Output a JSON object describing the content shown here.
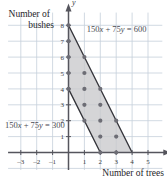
{
  "chart_data": {
    "type": "scatter",
    "title": "",
    "xlabel": "Number of trees",
    "ylabel": "Number of bushes",
    "xlim": [
      -3.8,
      5.9
    ],
    "ylim": [
      -1.1,
      8.8
    ],
    "grid": true,
    "legend": "none",
    "xticks": [
      -3,
      -2,
      -1,
      1,
      2,
      3,
      4,
      5
    ],
    "yticks": [
      1,
      2,
      3,
      4,
      5,
      6,
      7,
      8
    ],
    "x_axis_name": "x",
    "y_axis_name": "y",
    "annotations": [
      {
        "text": "150x + 75y = 600",
        "x": 1.15,
        "y": 7.55
      },
      {
        "text": "150x + 75y = 300",
        "x": -3.6,
        "y": 1.55
      }
    ],
    "lines": [
      {
        "label": "150x + 75y = 600",
        "from": [
          0,
          8
        ],
        "to": [
          4,
          0
        ],
        "slope": -2,
        "intercept": 8
      },
      {
        "label": "150x + 75y = 300",
        "from": [
          0,
          4
        ],
        "to": [
          2,
          0
        ],
        "slope": -2,
        "intercept": 4
      }
    ],
    "region": {
      "label": "feasible-region",
      "fill": "#c9c9cc",
      "vertices": [
        [
          0,
          8
        ],
        [
          4,
          0
        ],
        [
          2,
          0
        ],
        [
          0,
          4
        ]
      ]
    },
    "points": [
      [
        0,
        8
      ],
      [
        0,
        7
      ],
      [
        0,
        6
      ],
      [
        0,
        5
      ],
      [
        0,
        4
      ],
      [
        1,
        6
      ],
      [
        1,
        5
      ],
      [
        1,
        4
      ],
      [
        1,
        3
      ],
      [
        1,
        2
      ],
      [
        2,
        4
      ],
      [
        2,
        3
      ],
      [
        2,
        2
      ],
      [
        2,
        1
      ],
      [
        2,
        0
      ],
      [
        3,
        2
      ],
      [
        3,
        1
      ],
      [
        3,
        0
      ]
    ]
  },
  "labels": {
    "equation_upper": "150x + 75y = 600",
    "equation_lower": "150x + 75y = 300",
    "x_axis_title": "Number of trees",
    "y_axis_title_line1": "Number of",
    "y_axis_title_line2": "bushes",
    "x_axis_symbol": "x",
    "y_axis_symbol": "y"
  },
  "colors": {
    "grid": "#c5cfdb",
    "axis": "#55555d",
    "region_fill": "#c8c8cb",
    "boundary": "#35353b",
    "point": "#6d6d75",
    "text": "#30303a"
  }
}
